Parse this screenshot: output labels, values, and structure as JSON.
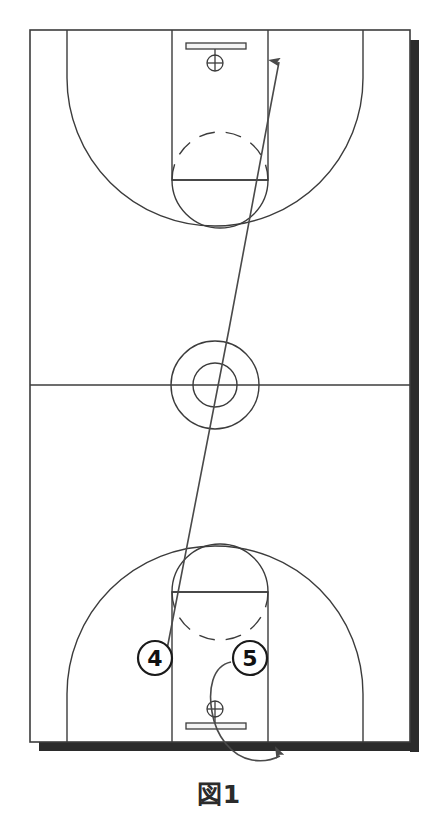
{
  "figure": {
    "caption": "図1",
    "caption_reading": "Figure 1",
    "width": 438,
    "height": 828
  },
  "colors": {
    "background": "#ffffff",
    "court_line": "#3c3c3c",
    "baseline_shadow": "#2b2b2b",
    "movement_line": "#4a4a4a",
    "player_marker_stroke": "#1a1a1a",
    "player_marker_fill": "#ffffff",
    "player_label": "#111111",
    "caption_text": "#2b2b2b"
  },
  "court": {
    "name": "basketball-full-court",
    "orientation": "vertical",
    "bounds": {
      "left": 30,
      "top": 30,
      "right": 410,
      "bottom": 742
    },
    "half_court_line_y": 385,
    "center_circle_outer_r": 44,
    "center_circle_inner_r": 22,
    "lane_left": 172,
    "lane_right": 268,
    "top_free_throw_line_y": 180,
    "bottom_free_throw_line_y": 592,
    "three_point_radius": 148,
    "top_hoop": {
      "cx": 215,
      "cy": 62,
      "backboard_y": 46
    },
    "bottom_hoop": {
      "cx": 215,
      "cy": 710,
      "backboard_y": 726
    }
  },
  "players": [
    {
      "id": "player-4",
      "label": "4",
      "x": 155,
      "y": 658
    },
    {
      "id": "player-5",
      "label": "5",
      "x": 250,
      "y": 658
    }
  ],
  "movements": [
    {
      "id": "cut-to-far-basket",
      "player": "4",
      "type": "cut",
      "arrowhead": "filled-triangle",
      "from": {
        "x": 163,
        "y": 668
      },
      "to": {
        "x": 279,
        "y": 52
      },
      "description": "Long slightly curved cut from the low post up the floor to the far basket"
    },
    {
      "id": "baseline-drift",
      "player": "5",
      "type": "cut",
      "arrowhead": "filled-triangle",
      "from": {
        "x": 228,
        "y": 663
      },
      "to": {
        "x": 281,
        "y": 759
      },
      "description": "Curls down through the paint past the rim and out below the baseline to the right"
    }
  ],
  "chart_data": {
    "type": "diagram",
    "title": "図1",
    "markers": [
      {
        "label": "4",
        "x": 155,
        "y": 658
      },
      {
        "label": "5",
        "x": 250,
        "y": 658
      }
    ],
    "court_features": [
      "outer boundary",
      "half court line",
      "center circle (outer + inner)",
      "top key / lane",
      "top free-throw circle (dashed upper arc, solid lower arc)",
      "top three-point arc",
      "top backboard and hoop",
      "bottom key / lane",
      "bottom free-throw circle (dashed lower arc, solid upper arc)",
      "bottom three-point arc",
      "bottom backboard and hoop",
      "drop shadow along right side and bottom baseline"
    ],
    "arrows": 2
  }
}
